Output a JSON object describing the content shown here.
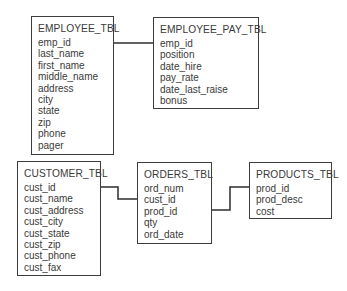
{
  "diagram": {
    "type": "entity-relationship",
    "tables": [
      {
        "name": "EMPLOYEE_TBL",
        "fields": [
          "emp_id",
          "last_name",
          "first_name",
          "middle_name",
          "address",
          "city",
          "state",
          "zip",
          "phone",
          "pager"
        ]
      },
      {
        "name": "EMPLOYEE_PAY_TBL",
        "fields": [
          "emp_id",
          "position",
          "date_hire",
          "pay_rate",
          "date_last_raise",
          "bonus"
        ]
      },
      {
        "name": "CUSTOMER_TBL",
        "fields": [
          "cust_id",
          "cust_name",
          "cust_address",
          "cust_city",
          "cust_state",
          "cust_zip",
          "cust_phone",
          "cust_fax"
        ]
      },
      {
        "name": "ORDERS_TBL",
        "fields": [
          "ord_num",
          "cust_id",
          "prod_id",
          "qty",
          "ord_date"
        ]
      },
      {
        "name": "PRODUCTS_TBL",
        "fields": [
          "prod_id",
          "prod_desc",
          "cost"
        ]
      }
    ],
    "relationships": [
      {
        "from": "EMPLOYEE_TBL.emp_id",
        "to": "EMPLOYEE_PAY_TBL.emp_id"
      },
      {
        "from": "CUSTOMER_TBL.cust_id",
        "to": "ORDERS_TBL.cust_id"
      },
      {
        "from": "ORDERS_TBL.prod_id",
        "to": "PRODUCTS_TBL.prod_id"
      }
    ]
  }
}
